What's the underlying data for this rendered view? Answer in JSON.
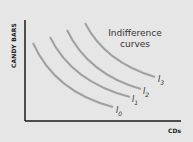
{
  "chart_data": {
    "type": "line",
    "title": "Indifference curves",
    "title_lines": [
      "Indifference",
      "curves"
    ],
    "xlabel": "CDs",
    "ylabel": "CANDY BARS",
    "grid": false,
    "legend": "none",
    "series": [
      {
        "name": "I0",
        "label": "I",
        "sub": "0",
        "path": "M33,43 Q55,92 113,107"
      },
      {
        "name": "I1",
        "label": "I",
        "sub": "1",
        "path": "M50,37 Q72,82 130,97"
      },
      {
        "name": "I2",
        "label": "I",
        "sub": "2",
        "path": "M67,30 Q88,74 141,89"
      },
      {
        "name": "I3",
        "label": "I",
        "sub": "3",
        "path": "M85,23 Q105,62 155,77"
      }
    ],
    "colors": {
      "curve": "#a0a0a0",
      "axis": "#1a1a1a",
      "background": "#e6e6e6"
    }
  }
}
